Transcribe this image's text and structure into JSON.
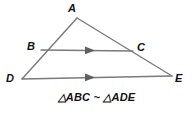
{
  "figure": {
    "background_color": "#ffffff",
    "line_color": "#7a7a7a",
    "text_color": "#111111",
    "width": 193,
    "height": 114
  },
  "vertices": [
    {
      "id": "A",
      "label": "A",
      "x": 77,
      "y": 18,
      "label_x": 68,
      "label_y": 3
    },
    {
      "id": "B",
      "label": "B",
      "x": 41,
      "y": 50,
      "label_x": 27,
      "label_y": 41
    },
    {
      "id": "C",
      "label": "C",
      "x": 133,
      "y": 51,
      "label_x": 137,
      "label_y": 42
    },
    {
      "id": "D",
      "label": "D",
      "x": 22,
      "y": 79,
      "label_x": 6,
      "label_y": 73
    },
    {
      "id": "E",
      "label": "E",
      "x": 172,
      "y": 76,
      "label_x": 175,
      "label_y": 73
    }
  ],
  "segments": [
    {
      "name": "segment-AD",
      "from": "A",
      "to": "D",
      "arrow": false
    },
    {
      "name": "segment-AE",
      "from": "A",
      "to": "E",
      "arrow": false
    },
    {
      "name": "segment-BC",
      "from": "B",
      "to": "C",
      "arrow": true,
      "arrow_x": 91,
      "arrow_y": 50
    },
    {
      "name": "segment-DE",
      "from": "D",
      "to": "E",
      "arrow": true,
      "arrow_x": 91,
      "arrow_y": 77
    }
  ],
  "caption": {
    "text": "△ABC ~ △ADE",
    "triangle_glyph": "△",
    "similar_glyph": "~",
    "first_triangle": "ABC",
    "second_triangle": "ADE"
  }
}
